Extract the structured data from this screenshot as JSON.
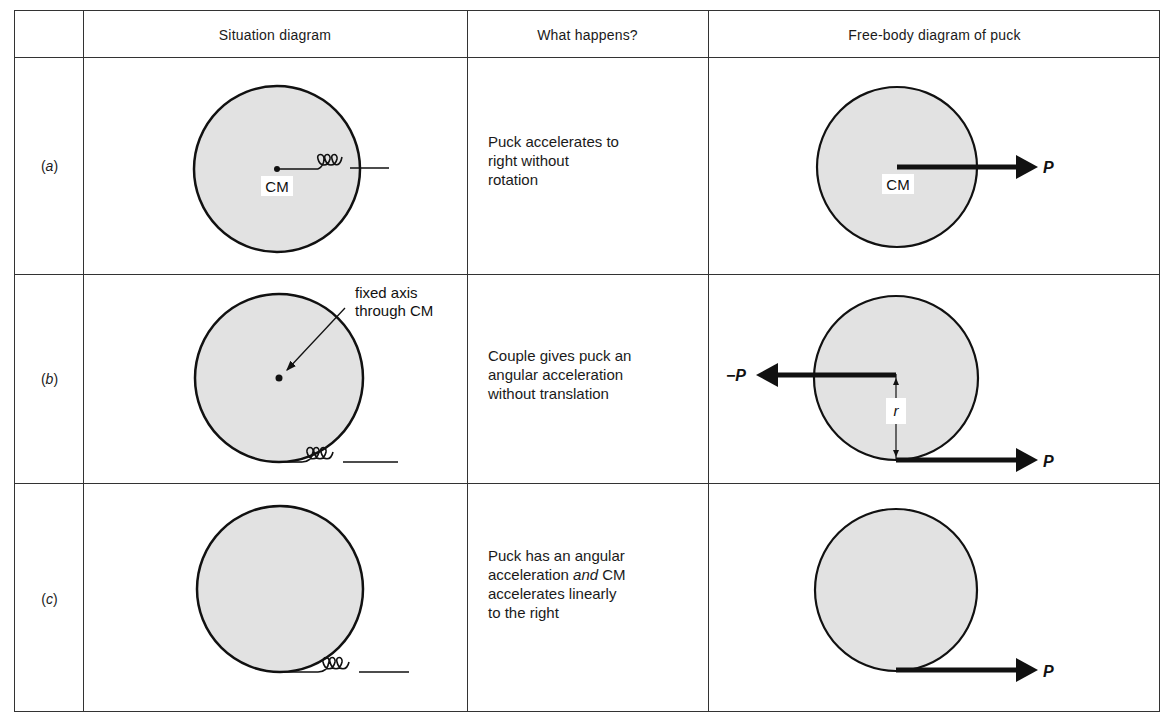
{
  "table": {
    "headers": [
      "",
      "Situation diagram",
      "What happens?",
      "Free-body diagram of puck"
    ],
    "rows": [
      {
        "label_open": "(",
        "label": "a",
        "label_close": ")",
        "situation": {
          "puck_label": "CM",
          "spring": "attached at CM, pulled right"
        },
        "what_happens": {
          "line1": "Puck accelerates to",
          "line2": "right without",
          "line3": "rotation"
        },
        "free_body": {
          "center_label": "CM",
          "force_right": "P"
        }
      },
      {
        "label_open": "(",
        "label": "b",
        "label_close": ")",
        "situation": {
          "annotation_line1": "fixed axis",
          "annotation_line2": "through CM",
          "spring": "attached at bottom edge"
        },
        "what_happens": {
          "line1": "Couple gives puck an",
          "line2": "angular acceleration",
          "line3": "without translation"
        },
        "free_body": {
          "force_left": "−P",
          "force_right": "P",
          "distance_label": "r"
        }
      },
      {
        "label_open": "(",
        "label": "c",
        "label_close": ")",
        "situation": {
          "spring": "attached at bottom edge, no fixed axis"
        },
        "what_happens": {
          "line1": "Puck has an angular",
          "line2_pre": "acceleration ",
          "line2_em": "and",
          "line2_post": " CM",
          "line3": "accelerates linearly",
          "line4": "to the right"
        },
        "free_body": {
          "force_right": "P"
        }
      }
    ]
  },
  "colors": {
    "puck_fill": "#e2e2e2",
    "line": "#1a1a1a",
    "border": "#333333"
  }
}
